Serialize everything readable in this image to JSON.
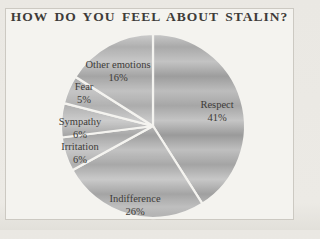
{
  "title": "HOW DO YOU FEEL ABOUT STALIN?",
  "chart_data": {
    "type": "pie",
    "title": "HOW DO YOU FEEL ABOUT STALIN?",
    "unit": "%",
    "direction": "clockwise",
    "start_angle_deg": 0,
    "legend": "none",
    "slices": [
      {
        "label": "Respect",
        "value": 41,
        "label_xy": [
          217,
          104
        ]
      },
      {
        "label": "Indifference",
        "value": 26,
        "label_xy": [
          135,
          198
        ]
      },
      {
        "label": "Irritation",
        "value": 6,
        "label_xy": [
          80,
          146
        ]
      },
      {
        "label": "Sympathy",
        "value": 6,
        "label_xy": [
          80,
          121
        ]
      },
      {
        "label": "Fear",
        "value": 5,
        "label_xy": [
          84,
          86
        ]
      },
      {
        "label": "Other emotions",
        "value": 16,
        "label_xy": [
          118,
          64
        ]
      }
    ],
    "colors": {
      "slice_light": "#c7c7c7",
      "slice_dark": "#9a9a9a",
      "divider": "#f4f3ef",
      "label_text": "#3d3b38",
      "panel_background": "#f4f3ef",
      "panel_border": "#ccc9c2",
      "page_background": "#eae8e3"
    }
  }
}
